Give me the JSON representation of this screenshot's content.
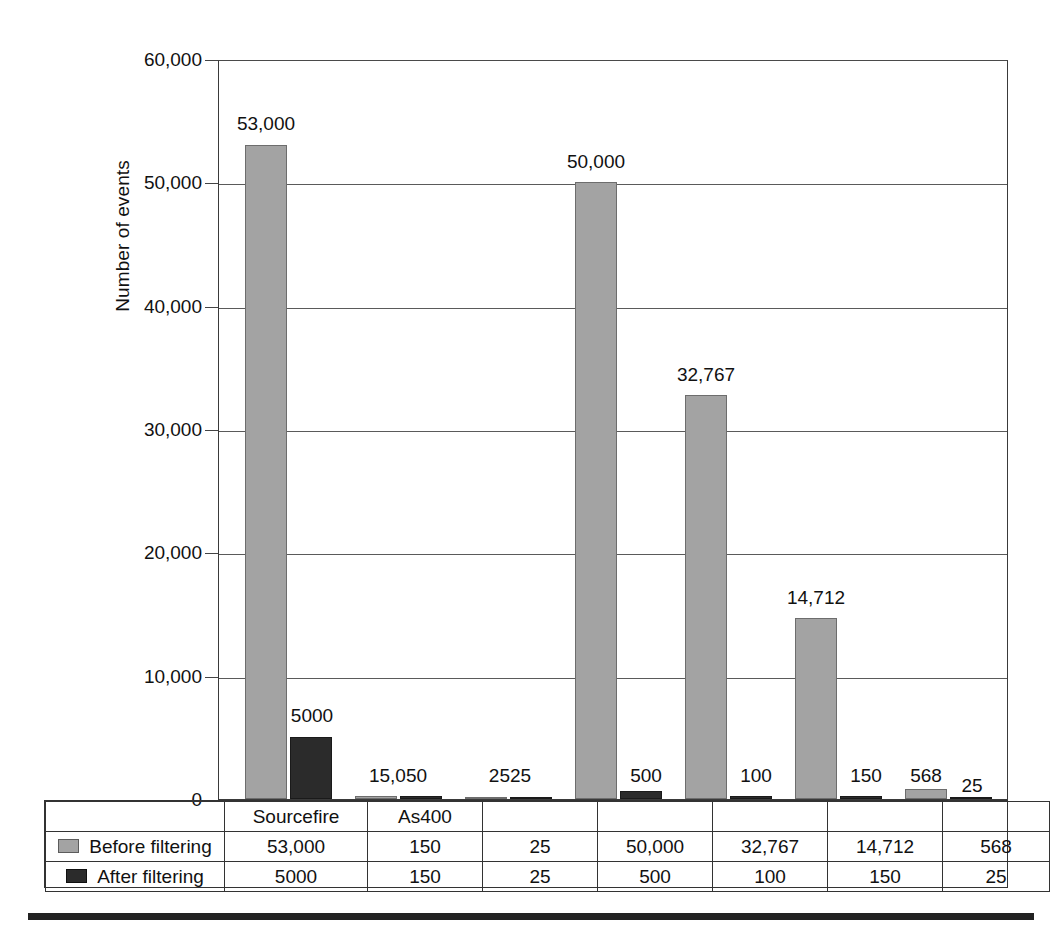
{
  "chart_data": {
    "type": "bar",
    "title": "",
    "xlabel": "",
    "ylabel": "Number of events",
    "ylim": [
      0,
      60000
    ],
    "grid": true,
    "legend_position": "data-table",
    "categories": [
      "Sourcefire",
      "As400",
      "",
      "",
      "",
      "",
      ""
    ],
    "ytick_labels": [
      "60,000",
      "50,000",
      "40,000",
      "30,000",
      "20,000",
      "10,000",
      "0"
    ],
    "ytick_values": [
      60000,
      50000,
      40000,
      30000,
      20000,
      10000,
      0
    ],
    "series": [
      {
        "name": "Before filtering",
        "color": "#a3a3a3",
        "values": [
          53000,
          150,
          25,
          50000,
          32767,
          14712,
          568
        ],
        "value_labels": [
          "53,000",
          "150",
          "25",
          "50,000",
          "32,767",
          "14,712",
          "568"
        ]
      },
      {
        "name": "After filtering",
        "color": "#2b2b2b",
        "values": [
          5000,
          150,
          25,
          500,
          100,
          150,
          25
        ],
        "value_labels": [
          "5000",
          "150",
          "25",
          "500",
          "100",
          "150",
          "25"
        ]
      }
    ],
    "annotations": [
      {
        "text": "53,000",
        "series": "Before filtering",
        "category_index": 0
      },
      {
        "text": "5000",
        "series": "After filtering",
        "category_index": 0
      },
      {
        "text": "15,050",
        "note": "overlapping labels 150 and 50 at category 2",
        "category_index": 1
      },
      {
        "text": "2525",
        "note": "overlapping labels 25 and 25 at category 3",
        "category_index": 2
      },
      {
        "text": "50,000",
        "series": "Before filtering",
        "category_index": 3
      },
      {
        "text": "500",
        "series": "After filtering",
        "category_index": 3
      },
      {
        "text": "32,767",
        "series": "Before filtering",
        "category_index": 4
      },
      {
        "text": "100",
        "series": "After filtering",
        "category_index": 4
      },
      {
        "text": "14,712",
        "series": "Before filtering",
        "category_index": 5
      },
      {
        "text": "150",
        "series": "After filtering",
        "category_index": 5
      },
      {
        "text": "568",
        "series": "Before filtering",
        "category_index": 6
      },
      {
        "text": "25",
        "series": "After filtering",
        "category_index": 6
      }
    ]
  },
  "axis": {
    "y_title": "Number of events",
    "ticks": [
      {
        "label": "60,000",
        "top": 60
      },
      {
        "label": "50,000",
        "top": 183
      },
      {
        "label": "40,000",
        "top": 307
      },
      {
        "label": "30,000",
        "top": 430
      },
      {
        "label": "20,000",
        "top": 553
      },
      {
        "label": "10,000",
        "top": 677
      },
      {
        "label": "0",
        "top": 800
      }
    ]
  },
  "bars": [
    {
      "label": "53,000",
      "series": "before",
      "left": 244,
      "width": 42,
      "height": 654,
      "label_left": 266,
      "label_top": 113
    },
    {
      "label": "5000",
      "series": "after",
      "left": 289,
      "width": 42,
      "height": 62,
      "label_left": 312,
      "label_top": 705
    },
    {
      "label": "15,050",
      "series": "before",
      "left": 354,
      "width": 42,
      "height": 3,
      "label_left": 398,
      "label_top": 765
    },
    {
      "label": "",
      "series": "after",
      "left": 399,
      "width": 42,
      "height": 3,
      "label_left": 0,
      "label_top": 0
    },
    {
      "label": "2525",
      "series": "before",
      "left": 464,
      "width": 42,
      "height": 2,
      "label_left": 510,
      "label_top": 765
    },
    {
      "label": "",
      "series": "after",
      "left": 509,
      "width": 42,
      "height": 2,
      "label_left": 0,
      "label_top": 0
    },
    {
      "label": "50,000",
      "series": "before",
      "left": 574,
      "width": 42,
      "height": 617,
      "label_left": 596,
      "label_top": 151
    },
    {
      "label": "500",
      "series": "after",
      "left": 619,
      "width": 42,
      "height": 8,
      "label_left": 646,
      "label_top": 765
    },
    {
      "label": "32,767",
      "series": "before",
      "left": 684,
      "width": 42,
      "height": 404,
      "label_left": 706,
      "label_top": 364
    },
    {
      "label": "100",
      "series": "after",
      "left": 729,
      "width": 42,
      "height": 3,
      "label_left": 756,
      "label_top": 765
    },
    {
      "label": "14,712",
      "series": "before",
      "left": 794,
      "width": 42,
      "height": 181,
      "label_left": 816,
      "label_top": 587
    },
    {
      "label": "150",
      "series": "after",
      "left": 839,
      "width": 42,
      "height": 3,
      "label_left": 866,
      "label_top": 765
    },
    {
      "label": "568",
      "series": "before",
      "left": 904,
      "width": 42,
      "height": 10,
      "label_left": 926,
      "label_top": 765
    },
    {
      "label": "25",
      "series": "after",
      "left": 949,
      "width": 42,
      "height": 2,
      "label_left": 972,
      "label_top": 775
    }
  ],
  "table": {
    "category_row": [
      "Sourcefire",
      "As400",
      "",
      "",
      "",
      "",
      ""
    ],
    "rows": [
      {
        "legend": "Before filtering",
        "swatch": "before",
        "values": [
          "53,000",
          "150",
          "25",
          "50,000",
          "32,767",
          "14,712",
          "568"
        ]
      },
      {
        "legend": "After filtering",
        "swatch": "after",
        "values": [
          "5000",
          "150",
          "25",
          "500",
          "100",
          "150",
          "25"
        ]
      }
    ]
  },
  "colors": {
    "before_filtering": "#a3a3a3",
    "after_filtering": "#2b2b2b",
    "axis": "#333333",
    "gridline": "#5a5a5a",
    "background": "#ffffff"
  }
}
